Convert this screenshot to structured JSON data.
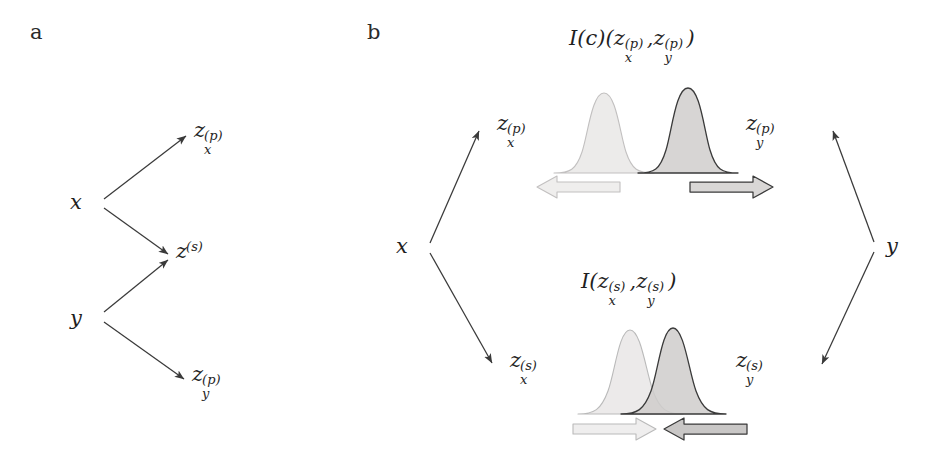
{
  "figure": {
    "background": "#ffffff",
    "stroke_color": "#3a3a3a",
    "panels": [
      {
        "id": "a",
        "label": "a"
      },
      {
        "id": "b",
        "label": "b"
      }
    ]
  },
  "panel_a": {
    "label": "a",
    "nodes": {
      "x": {
        "base": "x",
        "sub": "",
        "sup": ""
      },
      "y": {
        "base": "y",
        "sub": "",
        "sup": ""
      },
      "zxp": {
        "base": "z",
        "sub": "x",
        "sup": "(p)"
      },
      "zs": {
        "base": "z",
        "sub": "",
        "sup": "(s)"
      },
      "zyp": {
        "base": "z",
        "sub": "y",
        "sup": "(p)"
      }
    },
    "edges": [
      {
        "from": "x",
        "to": "zxp"
      },
      {
        "from": "x",
        "to": "zs"
      },
      {
        "from": "y",
        "to": "zs"
      },
      {
        "from": "y",
        "to": "zyp"
      }
    ]
  },
  "panel_b": {
    "label": "b",
    "nodes": {
      "x": {
        "base": "x",
        "sub": "",
        "sup": ""
      },
      "y": {
        "base": "y",
        "sub": "",
        "sup": ""
      },
      "zxp": {
        "base": "z",
        "sub": "x",
        "sup": "(p)"
      },
      "zyp": {
        "base": "z",
        "sub": "y",
        "sup": "(p)"
      },
      "zxs": {
        "base": "z",
        "sub": "x",
        "sup": "(s)"
      },
      "zys": {
        "base": "z",
        "sub": "y",
        "sup": "(s)"
      }
    },
    "edges": [
      {
        "from": "x",
        "to": "zxp"
      },
      {
        "from": "x",
        "to": "zxs"
      },
      {
        "from": "y",
        "to": "zyp"
      },
      {
        "from": "y",
        "to": "zys"
      }
    ],
    "formula_top": {
      "symbol": "I",
      "symbol_sup": "(c)",
      "open": "(",
      "arg1": {
        "base": "z",
        "sub": "x",
        "sup": "(p)"
      },
      "comma": ",",
      "arg2": {
        "base": "z",
        "sub": "y",
        "sup": "(p)"
      },
      "close": ")"
    },
    "formula_bottom": {
      "symbol": "I",
      "symbol_sup": "",
      "open": "(",
      "arg1": {
        "base": "z",
        "sub": "x",
        "sup": "(s)"
      },
      "comma": ",",
      "arg2": {
        "base": "z",
        "sub": "y",
        "sup": "(s)"
      },
      "close": ")"
    },
    "top_plot": {
      "meaning": "private representations pushed apart",
      "curve_light": {
        "fill": "#eceaea",
        "stroke": "#bdbdbd",
        "center_px": 604,
        "overlap": "low"
      },
      "curve_dark": {
        "fill": "#d8d6d5",
        "stroke": "#3a3a3a",
        "center_px": 688,
        "overlap": "low"
      },
      "arrow_left": {
        "direction": "left",
        "fill": "#efeeee",
        "stroke": "#bdbdbd"
      },
      "arrow_right": {
        "direction": "right",
        "fill": "#d9d7d6",
        "stroke": "#3a3a3a"
      }
    },
    "bottom_plot": {
      "meaning": "shared representations pulled together",
      "curve_light": {
        "fill": "#eceaea",
        "stroke": "#b5b5b5",
        "center_px": 630,
        "overlap": "high"
      },
      "curve_dark": {
        "fill": "#cfcdcc",
        "stroke": "#3a3a3a",
        "center_px": 673,
        "overlap": "high"
      },
      "arrow_left": {
        "direction": "right",
        "fill": "#efeeee",
        "stroke": "#b5b5b5"
      },
      "arrow_right": {
        "direction": "left",
        "fill": "#c9c7c6",
        "stroke": "#3a3a3a"
      }
    }
  }
}
